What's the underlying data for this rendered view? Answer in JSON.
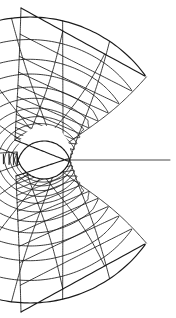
{
  "figure": {
    "title": "C-type structured grid around a blunt body",
    "kind": "computational-mesh",
    "background_color": "#ffffff",
    "line_color": "#1a1a1a",
    "canvas": {
      "width": 176,
      "height": 318
    }
  },
  "chart_data": {
    "type": "mesh",
    "title": "C-type structured grid around a blunt body",
    "xlabel": "",
    "ylabel": "",
    "grid": true,
    "legend": null,
    "annotations": [],
    "topology": {
      "family": "C-grid",
      "radial_lines": 21,
      "ring_lines": 13,
      "singular_points": [
        [
          15,
          140
        ],
        [
          16,
          176
        ]
      ],
      "wake_cut_y": 160
    },
    "body": {
      "shape": "circle",
      "center": [
        44,
        152
      ],
      "radius": 27
    },
    "outer_boundary": {
      "shape": "semicircle-with-straight-inlet",
      "center": [
        30,
        160
      ],
      "radius": 143,
      "left_edge_x": 21,
      "top_y": 8,
      "bottom_y": 312,
      "right_x": 172
    },
    "ring_fractions": [
      0.0,
      0.028,
      0.062,
      0.105,
      0.158,
      0.222,
      0.3,
      0.39,
      0.49,
      0.6,
      0.715,
      0.855,
      1.0
    ],
    "radial_params": [
      -1.0,
      -0.9,
      -0.8,
      -0.7,
      -0.6,
      -0.5,
      -0.4,
      -0.3,
      -0.2,
      -0.1,
      0.0,
      0.1,
      0.2,
      0.3,
      0.4,
      0.5,
      0.6,
      0.7,
      0.8,
      0.9,
      1.0
    ]
  }
}
